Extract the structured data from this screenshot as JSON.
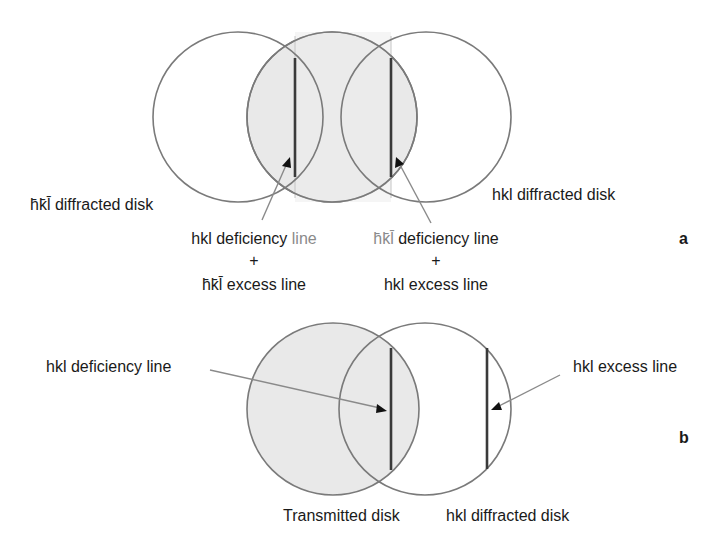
{
  "figure": {
    "panel_a": {
      "letter": "a",
      "labels": {
        "left_disk": "h̄k̄l̄ diffracted disk",
        "right_disk": "hkl diffracted disk",
        "left_annotation": {
          "line1_main": "hkl deficiency ",
          "line1_faded": "line",
          "plus": "+",
          "line3": "h̄k̄l̄ excess line"
        },
        "right_annotation": {
          "line1_faded": "h̄k̄l̄",
          "line1_main": " deficiency line",
          "plus": "+",
          "line3": "hkl excess line"
        }
      },
      "disks": [
        {
          "name": "hkl-bar-diffracted-disk",
          "cx": 238,
          "cy": 117,
          "r": 85,
          "fill": "none"
        },
        {
          "name": "transmitted-disk",
          "cx": 332,
          "cy": 117,
          "r": 85,
          "fill": "#e9e9e9"
        },
        {
          "name": "hkl-diffracted-disk",
          "cx": 426,
          "cy": 117,
          "r": 85,
          "fill": "none"
        }
      ]
    },
    "panel_b": {
      "letter": "b",
      "labels": {
        "deficiency": "hkl deficiency line",
        "excess": "hkl excess line",
        "transmitted": "Transmitted disk",
        "diffracted": "hkl diffracted disk"
      },
      "disks": [
        {
          "name": "transmitted-disk",
          "cx": 333,
          "cy": 409,
          "r": 86,
          "fill": "#e9e9e9"
        },
        {
          "name": "hkl-diffracted-disk",
          "cx": 425,
          "cy": 409,
          "r": 86,
          "fill": "none"
        }
      ]
    },
    "colors": {
      "disk_fill": "#e9e9e9",
      "disk_stroke": "#7a7a7a",
      "kikuchi_line": "#3a3a3a",
      "text": "#1a1a1a"
    }
  }
}
